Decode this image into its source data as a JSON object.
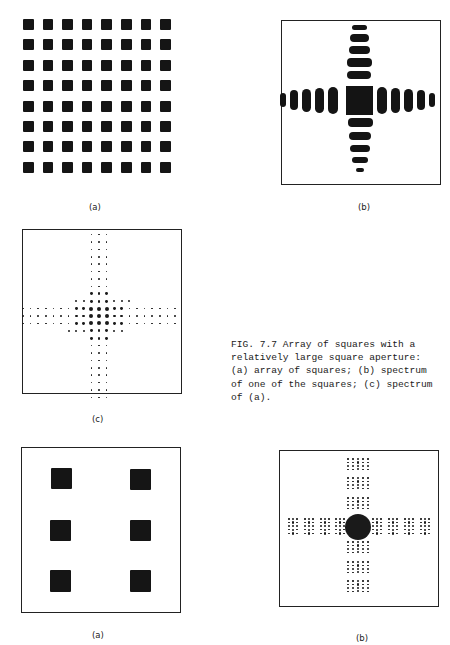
{
  "figure": {
    "number": "FIG. 7.7",
    "caption_lines": [
      "FIG. 7.7  Array of squares with a",
      "relatively large square aperture:",
      "(a) array of squares; (b) spectrum",
      "of one of the squares; (c) spectrum",
      "of (a)."
    ],
    "panels": {
      "top_a": {
        "label": "(a)",
        "description": "8x8 array of dark squares",
        "rows": 8,
        "cols": 8
      },
      "top_b": {
        "label": "(b)",
        "description": "Spectrum of one square: central square with cross-shaped side lobes"
      },
      "mid_c": {
        "label": "(c)",
        "description": "Spectrum of array: cross of discrete dots"
      },
      "bottom_a": {
        "label": "(a)",
        "description": "Six squares (3 rows x 2 cols) within a frame",
        "rows": 3,
        "cols": 2
      },
      "bottom_b": {
        "label": "(b)",
        "description": "Spectrum: central disk with clusters of dots along a cross"
      }
    }
  },
  "colors": {
    "ink": "#151515",
    "frame": "#222222",
    "background": "#ffffff"
  }
}
